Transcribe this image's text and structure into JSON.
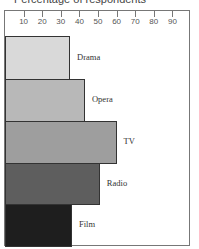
{
  "chart_data": {
    "type": "bar",
    "orientation": "horizontal",
    "title": "Percentage of respondents",
    "xlabel": "Percentage of respondents",
    "ylabel": "",
    "xlim": [
      0,
      100
    ],
    "ticks": [
      10,
      20,
      30,
      40,
      50,
      60,
      70,
      80,
      90
    ],
    "tick_labels": [
      "10",
      "20",
      "30",
      "40",
      "50",
      "60",
      "70",
      "80",
      "90"
    ],
    "categories": [
      "Drama",
      "Opera",
      "TV",
      "Radio",
      "Film"
    ],
    "values": [
      35,
      43,
      60,
      51,
      36
    ],
    "colors": [
      "#d9d9d9",
      "#b8b8b8",
      "#9e9e9e",
      "#5e5e5e",
      "#1e1e1e"
    ],
    "grid": false,
    "legend": "none (labels beside bars)"
  }
}
